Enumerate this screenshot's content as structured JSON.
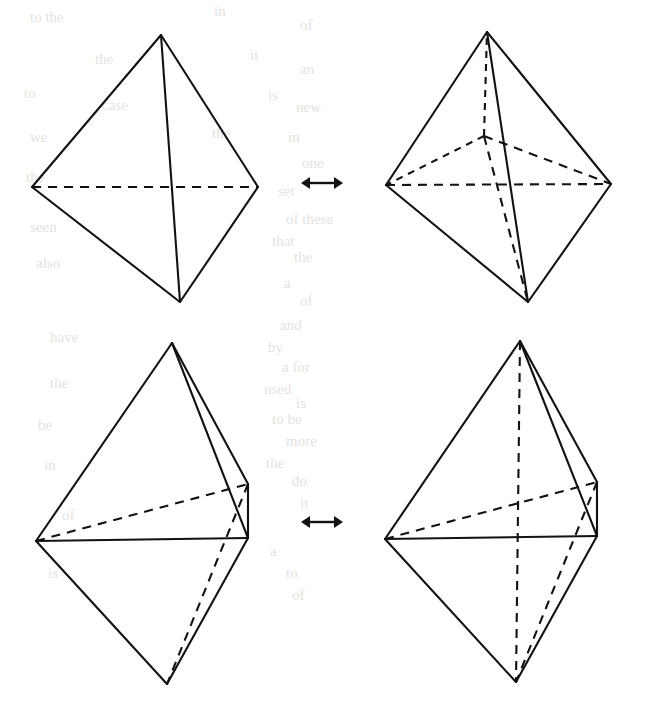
{
  "page": {
    "width": 647,
    "height": 723,
    "background_color": "#ffffff",
    "ink_color": "#121212",
    "bleed_text_color": "#cfcac4"
  },
  "relations": [
    {
      "name": "top-relation",
      "symbol": "↔",
      "x": 322,
      "y": 183
    },
    {
      "name": "bottom-relation",
      "symbol": "↔",
      "x": 322,
      "y": 522
    }
  ],
  "figures": [
    {
      "id": "top-left",
      "label": "tetrahedron-plain-front",
      "vertices": {
        "apex": [
          161,
          35
        ],
        "left": [
          32,
          187
        ],
        "right": [
          258,
          187
        ],
        "bottom": [
          180,
          302
        ]
      },
      "solid_edges": [
        [
          "apex",
          "left"
        ],
        [
          "apex",
          "right"
        ],
        [
          "left",
          "bottom"
        ],
        [
          "right",
          "bottom"
        ],
        [
          "apex",
          "bottom"
        ]
      ],
      "dashed_edges": [
        [
          "left",
          "right"
        ]
      ],
      "interior_vertices": []
    },
    {
      "id": "top-right",
      "label": "tetrahedron-with-interior-node",
      "vertices": {
        "apex": [
          487,
          32
        ],
        "left": [
          386,
          185
        ],
        "right": [
          611,
          184
        ],
        "bottom": [
          528,
          302
        ],
        "center": [
          484,
          136
        ]
      },
      "solid_edges": [
        [
          "apex",
          "left"
        ],
        [
          "apex",
          "right"
        ],
        [
          "left",
          "bottom"
        ],
        [
          "right",
          "bottom"
        ],
        [
          "apex",
          "bottom"
        ]
      ],
      "dashed_edges": [
        [
          "left",
          "right"
        ],
        [
          "center",
          "apex"
        ],
        [
          "center",
          "left"
        ],
        [
          "center",
          "right"
        ],
        [
          "center",
          "bottom"
        ]
      ],
      "interior_vertices": [
        "center"
      ]
    },
    {
      "id": "bottom-left",
      "label": "tetrahedron-edge-on-plain",
      "vertices": {
        "apex": [
          172,
          343
        ],
        "left": [
          36,
          541
        ],
        "rightback": [
          248,
          484
        ],
        "rightfront": [
          248,
          538
        ],
        "bottom": [
          167,
          684
        ]
      },
      "solid_edges": [
        [
          "apex",
          "left"
        ],
        [
          "apex",
          "rightback"
        ],
        [
          "apex",
          "rightfront"
        ],
        [
          "left",
          "rightfront"
        ],
        [
          "left",
          "bottom"
        ],
        [
          "rightback",
          "rightfront"
        ],
        [
          "rightfront",
          "bottom"
        ]
      ],
      "dashed_edges": [
        [
          "left",
          "rightback"
        ],
        [
          "rightback",
          "bottom"
        ]
      ],
      "interior_vertices": []
    },
    {
      "id": "bottom-right",
      "label": "tetrahedron-edge-on-bisected",
      "vertices": {
        "apex": [
          520,
          341
        ],
        "left": [
          385,
          539
        ],
        "rightback": [
          597,
          482
        ],
        "rightfront": [
          597,
          536
        ],
        "bottom": [
          516,
          682
        ]
      },
      "solid_edges": [
        [
          "apex",
          "left"
        ],
        [
          "apex",
          "rightback"
        ],
        [
          "apex",
          "rightfront"
        ],
        [
          "left",
          "rightfront"
        ],
        [
          "left",
          "bottom"
        ],
        [
          "rightback",
          "rightfront"
        ],
        [
          "rightfront",
          "bottom"
        ]
      ],
      "dashed_edges": [
        [
          "left",
          "rightback"
        ],
        [
          "rightback",
          "bottom"
        ],
        [
          "apex",
          "bottom"
        ]
      ],
      "interior_vertices": []
    }
  ],
  "bleed_through_text": [
    {
      "text": "to the",
      "x": 30,
      "y": 22
    },
    {
      "text": "in",
      "x": 214,
      "y": 16
    },
    {
      "text": "of",
      "x": 300,
      "y": 30
    },
    {
      "text": "the",
      "x": 95,
      "y": 64
    },
    {
      "text": "it",
      "x": 250,
      "y": 60
    },
    {
      "text": "an",
      "x": 300,
      "y": 74
    },
    {
      "text": "to",
      "x": 24,
      "y": 98
    },
    {
      "text": "case",
      "x": 102,
      "y": 110
    },
    {
      "text": "is",
      "x": 268,
      "y": 100
    },
    {
      "text": "new",
      "x": 296,
      "y": 112
    },
    {
      "text": "we",
      "x": 30,
      "y": 142
    },
    {
      "text": "the",
      "x": 212,
      "y": 138
    },
    {
      "text": "in",
      "x": 288,
      "y": 142
    },
    {
      "text": "one",
      "x": 302,
      "y": 168
    },
    {
      "text": "the",
      "x": 26,
      "y": 182
    },
    {
      "text": "set",
      "x": 278,
      "y": 196
    },
    {
      "text": "of these",
      "x": 286,
      "y": 224
    },
    {
      "text": "seen",
      "x": 30,
      "y": 232
    },
    {
      "text": "that",
      "x": 272,
      "y": 246
    },
    {
      "text": "the",
      "x": 294,
      "y": 262
    },
    {
      "text": "also",
      "x": 36,
      "y": 268
    },
    {
      "text": "a",
      "x": 284,
      "y": 288
    },
    {
      "text": "of",
      "x": 300,
      "y": 306
    },
    {
      "text": "and",
      "x": 280,
      "y": 330
    },
    {
      "text": "have",
      "x": 50,
      "y": 342
    },
    {
      "text": "by",
      "x": 268,
      "y": 352
    },
    {
      "text": "a for",
      "x": 282,
      "y": 372
    },
    {
      "text": "used",
      "x": 264,
      "y": 394
    },
    {
      "text": "is",
      "x": 296,
      "y": 408
    },
    {
      "text": "to be",
      "x": 272,
      "y": 424
    },
    {
      "text": "more",
      "x": 286,
      "y": 446
    },
    {
      "text": "the",
      "x": 266,
      "y": 468
    },
    {
      "text": "do",
      "x": 292,
      "y": 486
    },
    {
      "text": "it",
      "x": 300,
      "y": 508
    },
    {
      "text": "a",
      "x": 270,
      "y": 556
    },
    {
      "text": "to",
      "x": 286,
      "y": 578
    },
    {
      "text": "of",
      "x": 292,
      "y": 600
    },
    {
      "text": "the",
      "x": 50,
      "y": 388
    },
    {
      "text": "be",
      "x": 38,
      "y": 430
    },
    {
      "text": "in",
      "x": 44,
      "y": 470
    },
    {
      "text": "of",
      "x": 62,
      "y": 520
    },
    {
      "text": "is",
      "x": 48,
      "y": 578
    }
  ]
}
